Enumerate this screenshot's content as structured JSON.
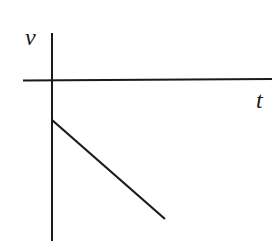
{
  "diagram": {
    "type": "velocity-time graph",
    "axes": {
      "y_label": "v",
      "x_label": "t"
    },
    "line": {
      "description": "straight line starting at negative velocity on v-axis, decreasing linearly with time",
      "start": {
        "x": 52,
        "y": 120
      },
      "end": {
        "x": 165,
        "y": 219
      }
    },
    "colors": {
      "stroke": "#1a1a1a",
      "background": "#ffffff"
    }
  }
}
